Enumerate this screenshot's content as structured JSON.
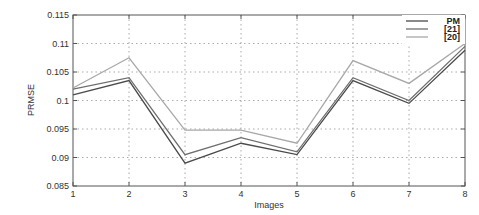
{
  "chart_data": {
    "type": "line",
    "title": "",
    "xlabel": "Images",
    "ylabel": "PRMSE",
    "x": [
      1,
      2,
      3,
      4,
      5,
      6,
      7,
      8
    ],
    "xlim": [
      1,
      8
    ],
    "ylim": [
      0.085,
      0.115
    ],
    "xticks": [
      "1",
      "2",
      "3",
      "4",
      "5",
      "6",
      "7",
      "8"
    ],
    "yticks": [
      "0.085",
      "0.09",
      "0.095",
      "0.1",
      "0.105",
      "0.11",
      "0.115"
    ],
    "grid": true,
    "legend_position": "upper right",
    "series": [
      {
        "name": "PM",
        "color": "#4a4a4a",
        "values": [
          0.101,
          0.1035,
          0.089,
          0.0925,
          0.0905,
          0.1035,
          0.0995,
          0.1088
        ]
      },
      {
        "name": "[21]",
        "color": "#6e6e6e",
        "values": [
          0.102,
          0.104,
          0.0905,
          0.0935,
          0.091,
          0.104,
          0.1,
          0.1095
        ]
      },
      {
        "name": "[20]",
        "color": "#a8a8a8",
        "values": [
          0.1022,
          0.1075,
          0.0948,
          0.0948,
          0.0925,
          0.107,
          0.103,
          0.11
        ]
      }
    ]
  }
}
